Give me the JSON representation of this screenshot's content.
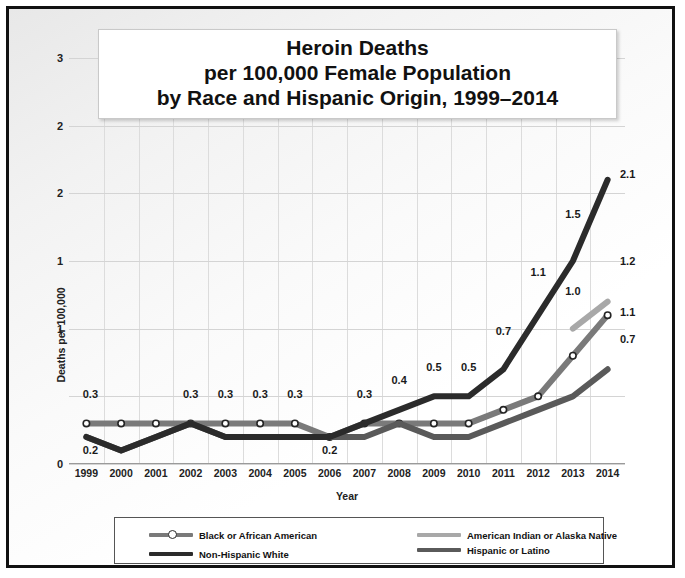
{
  "chart_data": {
    "type": "line",
    "title": "Heroin Deaths\nper 100,000 Female Population\nby Race and Hispanic Origin, 1999–2014",
    "title_lines": [
      "Heroin Deaths",
      "per 100,000 Female Population",
      "by Race and Hispanic Origin, 1999–2014"
    ],
    "xlabel": "Year",
    "ylabel": "Deaths per 100,000",
    "categories": [
      "1999",
      "2000",
      "2001",
      "2002",
      "2003",
      "2004",
      "2005",
      "2006",
      "2007",
      "2008",
      "2009",
      "2010",
      "2011",
      "2012",
      "2013",
      "2014"
    ],
    "ylim": [
      0,
      3.0
    ],
    "ytick_values": [
      0,
      0.5,
      1.0,
      1.5,
      2.0,
      2.5,
      3.0
    ],
    "ytick_labels": [
      "0",
      "1",
      "1",
      "2",
      "2",
      "3"
    ],
    "grid": true,
    "legend_position": "bottom",
    "series": [
      {
        "name": "Black or African American",
        "color": "#7a7a7a",
        "marker": "circle",
        "x": [
          "1999",
          "2000",
          "2001",
          "2002",
          "2003",
          "2004",
          "2005",
          "2006",
          "2007",
          "2008",
          "2009",
          "2010",
          "2011",
          "2012",
          "2013",
          "2014"
        ],
        "values": [
          0.3,
          0.3,
          0.3,
          0.3,
          0.3,
          0.3,
          0.3,
          0.2,
          0.3,
          0.3,
          0.3,
          0.3,
          0.4,
          0.5,
          0.8,
          1.1
        ]
      },
      {
        "name": "American Indian or Alaska Native",
        "color": "#a8a8a8",
        "marker": "none",
        "x": [
          "2013",
          "2014"
        ],
        "values": [
          1.0,
          1.2
        ]
      },
      {
        "name": "Hispanic or Latino",
        "color": "#5a5a5a",
        "marker": "none",
        "x": [
          "1999",
          "2000",
          "2001",
          "2002",
          "2003",
          "2004",
          "2005",
          "2006",
          "2007",
          "2008",
          "2009",
          "2010",
          "2011",
          "2012",
          "2013",
          "2014"
        ],
        "values": [
          0.2,
          0.1,
          0.2,
          0.3,
          0.2,
          0.2,
          0.2,
          0.2,
          0.2,
          0.3,
          0.2,
          0.2,
          0.3,
          0.4,
          0.5,
          0.7
        ]
      },
      {
        "name": "Non-Hispanic White",
        "color": "#2b2b2b",
        "marker": "none",
        "x": [
          "1999",
          "2000",
          "2001",
          "2002",
          "2003",
          "2004",
          "2005",
          "2006",
          "2007",
          "2008",
          "2009",
          "2010",
          "2011",
          "2012",
          "2013",
          "2014"
        ],
        "values": [
          0.2,
          0.1,
          0.2,
          0.3,
          0.2,
          0.2,
          0.2,
          0.2,
          0.3,
          0.4,
          0.5,
          0.5,
          0.7,
          1.1,
          1.5,
          2.1
        ]
      }
    ],
    "annotations": [
      {
        "text": "0.3",
        "x": "1999",
        "y": 0.52,
        "series": "Black or African American"
      },
      {
        "text": "0.2",
        "x": "1999",
        "y": 0.1,
        "series": "Non-Hispanic White"
      },
      {
        "text": "0.3",
        "x": "2002",
        "y": 0.52,
        "series": "Black or African American"
      },
      {
        "text": "0.3",
        "x": "2003",
        "y": 0.52,
        "series": "Black or African American"
      },
      {
        "text": "0.3",
        "x": "2004",
        "y": 0.52,
        "series": "Black or African American"
      },
      {
        "text": "0.3",
        "x": "2005",
        "y": 0.52,
        "series": "Black or African American"
      },
      {
        "text": "0.2",
        "x": "2006",
        "y": 0.1,
        "series": "Black or African American"
      },
      {
        "text": "0.3",
        "x": "2007",
        "y": 0.52,
        "series": "Non-Hispanic White"
      },
      {
        "text": "0.4",
        "x": "2008",
        "y": 0.62,
        "series": "Non-Hispanic White"
      },
      {
        "text": "0.5",
        "x": "2009",
        "y": 0.72,
        "series": "Non-Hispanic White"
      },
      {
        "text": "0.5",
        "x": "2010",
        "y": 0.72,
        "series": "Non-Hispanic White"
      },
      {
        "text": "0.7",
        "x": "2011",
        "y": 0.98,
        "series": "Non-Hispanic White"
      },
      {
        "text": "1.1",
        "x": "2012",
        "y": 1.42,
        "series": "Non-Hispanic White"
      },
      {
        "text": "1.5",
        "x": "2013",
        "y": 1.85,
        "series": "Non-Hispanic White"
      },
      {
        "text": "2.1",
        "x": "2014",
        "y": 2.14,
        "series": "Non-Hispanic White"
      },
      {
        "text": "1.0",
        "x": "2013",
        "y": 1.28,
        "series": "American Indian or Alaska Native"
      },
      {
        "text": "1.2",
        "x": "2014",
        "y": 1.5,
        "series": "American Indian or Alaska Native"
      },
      {
        "text": "1.1",
        "x": "2014",
        "y": 1.12,
        "series": "Black or African American"
      },
      {
        "text": "0.7",
        "x": "2014",
        "y": 0.92,
        "series": "Hispanic or Latino"
      }
    ]
  },
  "legend": {
    "items": [
      {
        "label": "Black or African American",
        "color": "#7a7a7a",
        "marker": "circle",
        "col": 0,
        "row": 0
      },
      {
        "label": "Non-Hispanic White",
        "color": "#2b2b2b",
        "marker": "none",
        "col": 0,
        "row": 2
      },
      {
        "label": "American Indian or Alaska Native",
        "color": "#a8a8a8",
        "marker": "none",
        "col": 1,
        "row": 0
      },
      {
        "label": "Hispanic or Latino",
        "color": "#5a5a5a",
        "marker": "none",
        "col": 1,
        "row": 1
      }
    ]
  }
}
